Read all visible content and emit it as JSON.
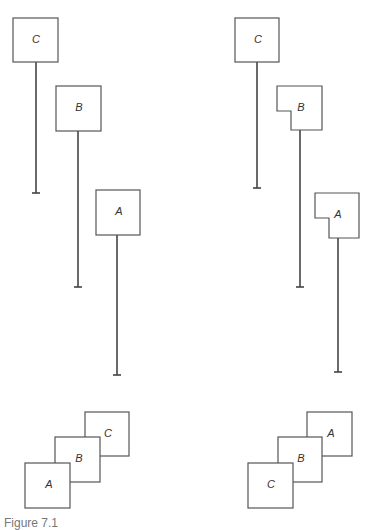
{
  "figure": {
    "caption": "Figure 7.1",
    "left_panel": {
      "windows": [
        {
          "label": "C",
          "x": 13,
          "y": 18,
          "w": 45,
          "h": 44,
          "line_x": 36,
          "line_end_y": 193
        },
        {
          "label": "B",
          "x": 56,
          "y": 86,
          "w": 45,
          "h": 45,
          "line_x": 78,
          "line_end_y": 287
        },
        {
          "label": "A",
          "x": 96,
          "y": 190,
          "w": 44,
          "h": 45,
          "line_x": 117,
          "line_end_y": 375
        }
      ],
      "stack_order_bottom_to_top": [
        "C",
        "B",
        "A"
      ]
    },
    "right_panel": {
      "windows": [
        {
          "label": "C",
          "x": 235,
          "y": 18,
          "w": 44,
          "h": 44,
          "line_x": 257,
          "line_end_y": 188,
          "notched": false
        },
        {
          "label": "B",
          "x": 277,
          "y": 86,
          "w": 45,
          "h": 44,
          "line_x": 300,
          "line_end_y": 287,
          "notched": true
        },
        {
          "label": "A",
          "x": 315,
          "y": 193,
          "w": 44,
          "h": 45,
          "line_x": 338,
          "line_end_y": 372,
          "notched": true
        }
      ],
      "stack_order_bottom_to_top": [
        "A",
        "B",
        "C"
      ]
    }
  },
  "colors": {
    "stroke": "#555555",
    "line": "#444444",
    "text": "#333333"
  }
}
